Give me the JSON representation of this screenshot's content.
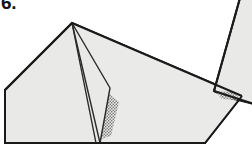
{
  "figure": {
    "step_number": "6.",
    "kind": "origami-fold-diagram",
    "caption": "",
    "canvas": {
      "width": 252,
      "height": 149
    },
    "colors": {
      "background": "#ffffff",
      "paper_fill": "#e8e8e6",
      "paper_fill_light": "#ededeb",
      "paper_fill_shadow": "#dedede",
      "outline": "#1a1a1a",
      "crease": "#333333",
      "stipple": "#6b6b6b",
      "label": "#141414"
    },
    "line_widths": {
      "outline": 2,
      "crease": 1.3,
      "thin": 1
    },
    "shapes": [
      {
        "name": "main-body-panel",
        "role": "primary folded paper body",
        "fill": "#e8e8e6",
        "stroke": "#1a1a1a",
        "points": "5,90 5,143 205,143 242,96 72,23"
      },
      {
        "name": "right-upper-panel",
        "role": "upper right sloping paper face",
        "fill": "#ededeb",
        "stroke": "#1a1a1a",
        "points": "72,23 242,96 205,143 5,143 5,90"
      },
      {
        "name": "left-slope-panel",
        "role": "left sloping face from apex to left corner",
        "fill": "#e8e8e6",
        "stroke": "#1a1a1a",
        "points": "72,23 5,90 5,143"
      },
      {
        "name": "standing-flap",
        "role": "vertical flap standing up on the right",
        "fill": "#e8e8e6",
        "stroke": "#1a1a1a",
        "points": "240,0 252,0 252,103 227,97 215,92"
      },
      {
        "name": "center-fold-wedge",
        "role": "narrow folded wedge from apex to bottom vertex",
        "fill": "#e8e8e6",
        "stroke": "#333333",
        "points": "72,23 110,88 100,143 88,120"
      }
    ],
    "crease_lines": [
      {
        "name": "crease-apex-to-bottom-left",
        "from": [
          72,
          23
        ],
        "to": [
          100,
          143
        ]
      },
      {
        "name": "crease-apex-to-mid-bend",
        "from": [
          72,
          23
        ],
        "to": [
          110,
          88
        ]
      },
      {
        "name": "crease-mid-bend-to-bottom",
        "from": [
          110,
          88
        ],
        "to": [
          100,
          143
        ]
      }
    ],
    "stipple_regions": [
      {
        "name": "center-stipple-shadow",
        "role": "dotted shading showing hidden layer near center crease",
        "points": "106,93 118,101 110,135 100,138",
        "dot_color": "#5e5e5e"
      },
      {
        "name": "right-stipple-shadow",
        "role": "dotted shading at base of standing flap",
        "points": "216,92 232,92 240,100 221,99",
        "dot_color": "#5e5e5e"
      }
    ]
  }
}
